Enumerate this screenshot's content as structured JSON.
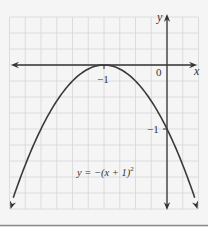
{
  "chart_data": {
    "type": "line",
    "title": "",
    "equation": "y = −(x + 1)²",
    "xlabel": "x",
    "ylabel": "y",
    "xlim": [
      -2.5,
      0.5
    ],
    "ylim": [
      -2.25,
      0.75
    ],
    "grid": true,
    "grid_step": 0.25,
    "tick_labels": {
      "origin": "0",
      "x": [
        {
          "value": -1,
          "label": "−1"
        }
      ],
      "y": [
        {
          "value": -1,
          "label": "−1"
        }
      ]
    },
    "series": [
      {
        "name": "y = −(x + 1)²",
        "x": [
          -2.5,
          -2.25,
          -2,
          -1.75,
          -1.5,
          -1.25,
          -1,
          -0.75,
          -0.5,
          -0.25,
          0,
          0.25,
          0.5
        ],
        "y": [
          -2.25,
          -1.5625,
          -1,
          -0.5625,
          -0.25,
          -0.0625,
          0,
          -0.0625,
          -0.25,
          -0.5625,
          -1,
          -1.5625,
          -2.25
        ]
      }
    ],
    "annotations": [
      {
        "text": "y = −(x + 1)²",
        "x": -1.45,
        "y": -1.7
      },
      {
        "text": "vertex",
        "x": -1,
        "y": 0
      }
    ]
  },
  "labels": {
    "x_axis": "x",
    "y_axis": "y",
    "origin": "0",
    "x_tick": "−1",
    "y_tick": "−1",
    "equation_main": "y = −(x + 1)",
    "equation_exp": "2"
  },
  "colors": {
    "background": "#f5f5f5",
    "grid": "#d6d6d6",
    "axis": "#333333",
    "curve": "#3a3a3a"
  }
}
